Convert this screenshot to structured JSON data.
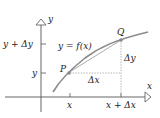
{
  "diagram": {
    "type": "derivative-secant-illustration",
    "axes": {
      "x_axis_label": "x",
      "y_axis_label": "y"
    },
    "curve_label": "y = f(x)",
    "points": [
      {
        "name": "P",
        "label": "P"
      },
      {
        "name": "Q",
        "label": "Q"
      }
    ],
    "increments": {
      "dx_label": "Δx",
      "dy_label": "Δy"
    },
    "x_ticks": [
      {
        "label": "x"
      },
      {
        "label": "x + Δx"
      }
    ],
    "y_ticks": [
      {
        "label": "y + Δy"
      },
      {
        "label": "y"
      }
    ],
    "colors": {
      "axis": "#555555",
      "curve": "#8a8a8a",
      "secant": "#aaaaaa",
      "dashed": "#999999",
      "text": "#222222"
    }
  }
}
